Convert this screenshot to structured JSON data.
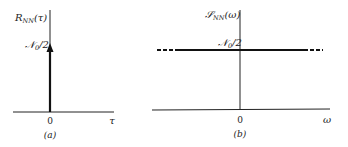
{
  "panel_a": {
    "ylabel_main": "R",
    "ylabel_sub": "NN",
    "ylabel_arg": "(τ)",
    "impulse_label_main": "𝒩",
    "impulse_label_sub": "0",
    "impulse_label_rest": "/2",
    "origin_tick": "0",
    "xlabel": "τ",
    "caption": "(a)"
  },
  "panel_b": {
    "ylabel_main": "𝒮",
    "ylabel_sub": "NN",
    "ylabel_arg": "(ω)",
    "level_label_main": "𝒩",
    "level_label_sub": "0",
    "level_label_rest": "/2",
    "origin_tick": "0",
    "xlabel": "ω",
    "caption": "(b)"
  },
  "colors": {
    "ink": "#222222",
    "background": "#ffffff"
  }
}
